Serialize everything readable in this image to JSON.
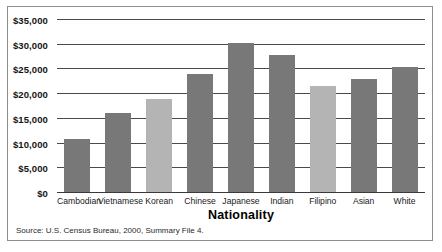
{
  "figure": {
    "top_clipped_text": "",
    "source_note": "Source: U.S. Census Bureau, 2000, Summary File 4."
  },
  "chart_data": {
    "type": "bar",
    "title": "",
    "xlabel": "Nationality",
    "ylabel": "",
    "ylim": [
      0,
      35000
    ],
    "ytick_values": [
      0,
      5000,
      10000,
      15000,
      20000,
      25000,
      30000,
      35000
    ],
    "ytick_labels": [
      "$0",
      "$5,000",
      "$10,000",
      "$15,000",
      "$20,000",
      "$25,000",
      "$30,000",
      "$35,000"
    ],
    "grid": true,
    "legend": "none",
    "categories": [
      "Cambodian",
      "Vietnamese",
      "Korean",
      "Chinese",
      "Japanese",
      "Indian",
      "Filipino",
      "Asian",
      "White"
    ],
    "values": [
      10800,
      16000,
      18800,
      23800,
      30200,
      27800,
      21500,
      22800,
      25300
    ],
    "bar_colors": [
      "#787878",
      "#787878",
      "#b4b4b4",
      "#787878",
      "#787878",
      "#787878",
      "#b4b4b4",
      "#787878",
      "#787878"
    ],
    "colors": {
      "bar_dark": "#787878",
      "bar_light": "#b4b4b4",
      "gridline": "#4a4a4a",
      "frame": "#8d8d8d"
    }
  }
}
